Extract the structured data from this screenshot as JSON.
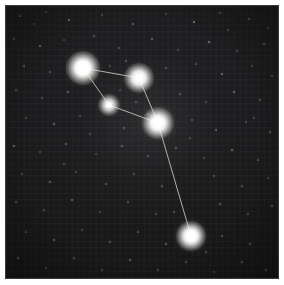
{
  "image": {
    "title": "Constellation star chart",
    "subject": "night-sky-star-field-with-asterism",
    "frame_color": "#ffffff",
    "sky_background_color": "#1b1b1d",
    "star_color": "#ffffff",
    "line_color": "#cfcfc9",
    "width": 284,
    "height": 285
  },
  "chart_data": {
    "type": "scatter",
    "xlabel": "",
    "ylabel": "",
    "xlim": [
      0,
      272
    ],
    "ylim": [
      0,
      272
    ],
    "grid": true,
    "legend": "none",
    "coordinate_space": "image-pixels-within-sky-field",
    "stars": [
      {
        "id": "star-1",
        "label": "",
        "x": 77,
        "y": 62,
        "radius": 5.0,
        "glow": 17,
        "brightness": 1.0
      },
      {
        "id": "star-2",
        "label": "",
        "x": 133,
        "y": 72,
        "radius": 4.4,
        "glow": 15,
        "brightness": 0.92
      },
      {
        "id": "star-3",
        "label": "",
        "x": 103,
        "y": 99,
        "radius": 3.3,
        "glow": 11,
        "brightness": 0.72
      },
      {
        "id": "star-4",
        "label": "",
        "x": 152,
        "y": 117,
        "radius": 4.8,
        "glow": 16,
        "brightness": 0.97
      },
      {
        "id": "star-5",
        "label": "",
        "x": 185,
        "y": 230,
        "radius": 4.6,
        "glow": 15,
        "brightness": 0.94
      }
    ],
    "lines": [
      {
        "from": "star-1",
        "to": "star-2"
      },
      {
        "from": "star-1",
        "to": "star-3"
      },
      {
        "from": "star-3",
        "to": "star-4"
      },
      {
        "from": "star-2",
        "to": "star-4"
      },
      {
        "from": "star-4",
        "to": "star-5"
      }
    ],
    "field_stars": [
      {
        "x": 14,
        "y": 10,
        "r": 1.0
      },
      {
        "x": 40,
        "y": 6,
        "r": 0.8
      },
      {
        "x": 63,
        "y": 14,
        "r": 1.3
      },
      {
        "x": 96,
        "y": 9,
        "r": 0.9
      },
      {
        "x": 127,
        "y": 18,
        "r": 1.1
      },
      {
        "x": 160,
        "y": 8,
        "r": 0.8
      },
      {
        "x": 188,
        "y": 16,
        "r": 1.4
      },
      {
        "x": 214,
        "y": 7,
        "r": 0.9
      },
      {
        "x": 243,
        "y": 13,
        "r": 1.0
      },
      {
        "x": 262,
        "y": 22,
        "r": 0.8
      },
      {
        "x": 8,
        "y": 33,
        "r": 0.9
      },
      {
        "x": 34,
        "y": 40,
        "r": 1.2
      },
      {
        "x": 58,
        "y": 34,
        "r": 0.8
      },
      {
        "x": 88,
        "y": 30,
        "r": 1.0
      },
      {
        "x": 113,
        "y": 42,
        "r": 0.9
      },
      {
        "x": 146,
        "y": 33,
        "r": 1.1
      },
      {
        "x": 172,
        "y": 44,
        "r": 0.8
      },
      {
        "x": 203,
        "y": 36,
        "r": 1.3
      },
      {
        "x": 231,
        "y": 45,
        "r": 0.9
      },
      {
        "x": 258,
        "y": 38,
        "r": 1.0
      },
      {
        "x": 18,
        "y": 60,
        "r": 1.1
      },
      {
        "x": 44,
        "y": 66,
        "r": 0.9
      },
      {
        "x": 104,
        "y": 60,
        "r": 0.8
      },
      {
        "x": 120,
        "y": 55,
        "r": 0.9
      },
      {
        "x": 160,
        "y": 62,
        "r": 1.0
      },
      {
        "x": 190,
        "y": 58,
        "r": 0.9
      },
      {
        "x": 216,
        "y": 68,
        "r": 1.2
      },
      {
        "x": 246,
        "y": 60,
        "r": 0.8
      },
      {
        "x": 266,
        "y": 70,
        "r": 0.9
      },
      {
        "x": 10,
        "y": 84,
        "r": 1.0
      },
      {
        "x": 36,
        "y": 92,
        "r": 0.9
      },
      {
        "x": 62,
        "y": 86,
        "r": 1.1
      },
      {
        "x": 130,
        "y": 96,
        "r": 0.9
      },
      {
        "x": 174,
        "y": 88,
        "r": 1.0
      },
      {
        "x": 200,
        "y": 96,
        "r": 0.8
      },
      {
        "x": 228,
        "y": 86,
        "r": 1.2
      },
      {
        "x": 254,
        "y": 94,
        "r": 0.9
      },
      {
        "x": 20,
        "y": 112,
        "r": 0.9
      },
      {
        "x": 48,
        "y": 118,
        "r": 1.1
      },
      {
        "x": 74,
        "y": 110,
        "r": 0.8
      },
      {
        "x": 118,
        "y": 122,
        "r": 1.0
      },
      {
        "x": 186,
        "y": 114,
        "r": 0.9
      },
      {
        "x": 210,
        "y": 124,
        "r": 1.1
      },
      {
        "x": 240,
        "y": 116,
        "r": 0.8
      },
      {
        "x": 264,
        "y": 126,
        "r": 1.0
      },
      {
        "x": 8,
        "y": 140,
        "r": 1.2
      },
      {
        "x": 34,
        "y": 146,
        "r": 0.9
      },
      {
        "x": 60,
        "y": 138,
        "r": 1.0
      },
      {
        "x": 90,
        "y": 148,
        "r": 0.8
      },
      {
        "x": 116,
        "y": 140,
        "r": 1.1
      },
      {
        "x": 142,
        "y": 150,
        "r": 0.9
      },
      {
        "x": 170,
        "y": 142,
        "r": 1.0
      },
      {
        "x": 198,
        "y": 152,
        "r": 0.8
      },
      {
        "x": 226,
        "y": 144,
        "r": 1.2
      },
      {
        "x": 252,
        "y": 154,
        "r": 0.9
      },
      {
        "x": 16,
        "y": 168,
        "r": 0.9
      },
      {
        "x": 44,
        "y": 176,
        "r": 1.1
      },
      {
        "x": 70,
        "y": 166,
        "r": 0.8
      },
      {
        "x": 100,
        "y": 178,
        "r": 1.0
      },
      {
        "x": 128,
        "y": 168,
        "r": 0.9
      },
      {
        "x": 156,
        "y": 180,
        "r": 1.1
      },
      {
        "x": 208,
        "y": 170,
        "r": 0.9
      },
      {
        "x": 236,
        "y": 180,
        "r": 1.0
      },
      {
        "x": 262,
        "y": 172,
        "r": 0.8
      },
      {
        "x": 10,
        "y": 196,
        "r": 1.0
      },
      {
        "x": 38,
        "y": 204,
        "r": 0.9
      },
      {
        "x": 66,
        "y": 194,
        "r": 1.2
      },
      {
        "x": 94,
        "y": 206,
        "r": 0.8
      },
      {
        "x": 122,
        "y": 196,
        "r": 1.0
      },
      {
        "x": 150,
        "y": 208,
        "r": 0.9
      },
      {
        "x": 214,
        "y": 198,
        "r": 1.1
      },
      {
        "x": 242,
        "y": 208,
        "r": 0.9
      },
      {
        "x": 266,
        "y": 200,
        "r": 1.0
      },
      {
        "x": 20,
        "y": 226,
        "r": 0.9
      },
      {
        "x": 48,
        "y": 234,
        "r": 1.1
      },
      {
        "x": 76,
        "y": 224,
        "r": 0.8
      },
      {
        "x": 104,
        "y": 236,
        "r": 1.0
      },
      {
        "x": 132,
        "y": 226,
        "r": 0.9
      },
      {
        "x": 160,
        "y": 238,
        "r": 1.1
      },
      {
        "x": 216,
        "y": 230,
        "r": 0.9
      },
      {
        "x": 244,
        "y": 238,
        "r": 1.0
      },
      {
        "x": 12,
        "y": 252,
        "r": 1.1
      },
      {
        "x": 40,
        "y": 262,
        "r": 0.9
      },
      {
        "x": 68,
        "y": 252,
        "r": 1.0
      },
      {
        "x": 96,
        "y": 264,
        "r": 0.8
      },
      {
        "x": 124,
        "y": 254,
        "r": 1.1
      },
      {
        "x": 152,
        "y": 264,
        "r": 0.9
      },
      {
        "x": 180,
        "y": 256,
        "r": 1.0
      },
      {
        "x": 208,
        "y": 266,
        "r": 0.8
      },
      {
        "x": 236,
        "y": 256,
        "r": 1.1
      },
      {
        "x": 260,
        "y": 264,
        "r": 0.9
      },
      {
        "x": 84,
        "y": 128,
        "r": 0.8
      },
      {
        "x": 58,
        "y": 158,
        "r": 0.9
      },
      {
        "x": 184,
        "y": 132,
        "r": 0.8
      },
      {
        "x": 248,
        "y": 112,
        "r": 0.9
      },
      {
        "x": 28,
        "y": 18,
        "r": 0.8
      },
      {
        "x": 222,
        "y": 24,
        "r": 0.9
      },
      {
        "x": 142,
        "y": 108,
        "r": 0.8
      },
      {
        "x": 168,
        "y": 206,
        "r": 0.9
      },
      {
        "x": 114,
        "y": 84,
        "r": 0.8
      },
      {
        "x": 200,
        "y": 246,
        "r": 0.9
      }
    ]
  }
}
